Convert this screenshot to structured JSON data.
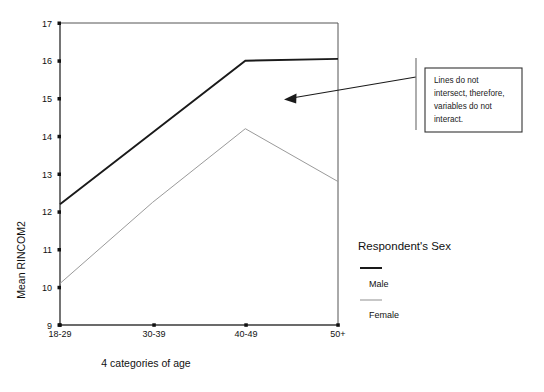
{
  "chart_data": {
    "type": "line",
    "title": "",
    "xlabel": "4 categories of age",
    "ylabel": "Mean RINCOM2",
    "categories": [
      "18-29",
      "30-39",
      "40-49",
      "50+"
    ],
    "ylim": [
      9,
      17
    ],
    "yticks": [
      9,
      10,
      11,
      12,
      13,
      14,
      15,
      16,
      17
    ],
    "grid": false,
    "legend_position": "right",
    "legend_title": "Respondent's Sex",
    "series": [
      {
        "name": "Male",
        "values": [
          12.2,
          14.1,
          16.0,
          16.05
        ],
        "color": "#1a1a1a",
        "width": 1.9
      },
      {
        "name": "Female",
        "values": [
          10.1,
          12.25,
          14.2,
          12.8
        ],
        "color": "#9a9a9a",
        "width": 1.0
      }
    ],
    "annotations": [
      {
        "name": "no-interaction-note",
        "lines": [
          "Lines do not",
          "intersect, therefore,",
          "variables do not",
          "interact."
        ],
        "box": {
          "x": 425,
          "y": 68,
          "width": 97,
          "height": 64
        },
        "arrow": {
          "x1": 416,
          "y1": 77,
          "x2": 286,
          "y2": 99
        }
      }
    ]
  },
  "axes": {
    "x_tick_labels": [
      "18-29",
      "30-39",
      "40-49",
      "50+"
    ],
    "y_tick_labels": [
      "9",
      "10",
      "11",
      "12",
      "13",
      "14",
      "15",
      "16",
      "17"
    ],
    "x_axis_title": "4 categories of age",
    "y_axis_title": "Mean RINCOM2"
  },
  "legend": {
    "title": "Respondent's Sex",
    "items": [
      {
        "label": "Male",
        "color": "#1a1a1a",
        "width": 2.0
      },
      {
        "label": "Female",
        "color": "#9a9a9a",
        "width": 1.0
      }
    ]
  },
  "annotation": {
    "line1": "Lines do not",
    "line2": "intersect, therefore,",
    "line3": "variables do not",
    "line4": "interact."
  }
}
